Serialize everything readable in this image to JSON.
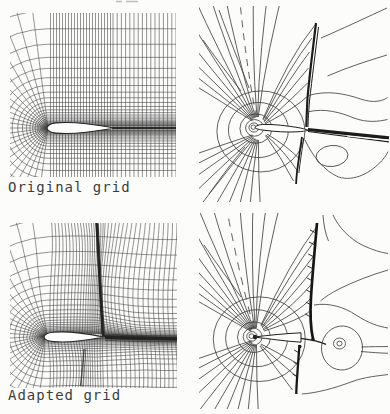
{
  "figure": {
    "background_color": "#fcfcfb",
    "ink_color": "#2e2e2e",
    "shock_color": "#111111",
    "labels": {
      "original": "Original grid",
      "adapted": "Adapted grid"
    }
  }
}
